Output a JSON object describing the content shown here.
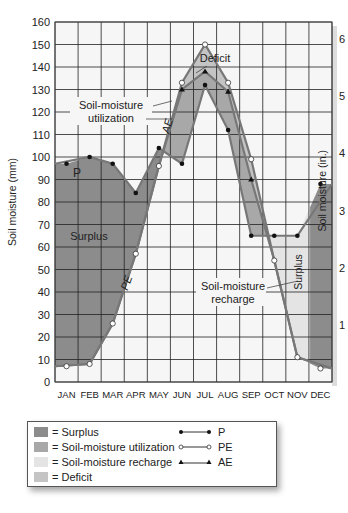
{
  "chart_data": {
    "type": "line",
    "title": "",
    "xlabel": "",
    "ylabel": "Soil moisture (mm)",
    "ylabel_right": "Soil moisture (in.)",
    "ylim": [
      0,
      160
    ],
    "ylim_right": [
      0,
      6.3
    ],
    "yticks": [
      0,
      10,
      20,
      30,
      40,
      50,
      60,
      70,
      80,
      90,
      100,
      110,
      120,
      130,
      140,
      150,
      160
    ],
    "yticks_right": [
      1,
      2,
      3,
      4,
      5,
      6
    ],
    "grid": true,
    "categories": [
      "JAN",
      "FEB",
      "MAR",
      "APR",
      "MAY",
      "JUN",
      "JUL",
      "AUG",
      "SEP",
      "OCT",
      "NOV",
      "DEC"
    ],
    "series": [
      {
        "name": "P",
        "marker": "filled-circle",
        "values": [
          97,
          100,
          97,
          84,
          104,
          97,
          132,
          112,
          65,
          65,
          65,
          88
        ]
      },
      {
        "name": "PE",
        "marker": "open-circle",
        "values": [
          7,
          8,
          26,
          57,
          96,
          133,
          150,
          133,
          99,
          54,
          11,
          6
        ]
      },
      {
        "name": "AE",
        "marker": "triangle",
        "values": [
          7,
          8,
          26,
          57,
          96,
          130,
          138,
          129,
          90,
          54,
          11,
          6
        ]
      }
    ],
    "annotations": [
      {
        "text": "Deficit",
        "x": "JUL",
        "y": 145
      },
      {
        "text": "Soil-moisture utilization",
        "x": "APR",
        "y": 125
      },
      {
        "text": "AE",
        "x": "JUN",
        "y": 112
      },
      {
        "text": "P",
        "x": "FEB",
        "y": 93
      },
      {
        "text": "Surplus",
        "x": "FEB",
        "y": 67
      },
      {
        "text": "PE",
        "x": "APR",
        "y": 45
      },
      {
        "text": "Soil-moisture recharge",
        "x": "AUG",
        "y": 42
      },
      {
        "text": "Surplus",
        "x": "DEC",
        "y": 50
      }
    ],
    "regions": [
      {
        "name": "Surplus",
        "color": "#8c8c8c"
      },
      {
        "name": "Soil-moisture utilization",
        "color": "#a8a8a8"
      },
      {
        "name": "Soil-moisture recharge",
        "color": "#e4e4e4"
      },
      {
        "name": "Deficit",
        "color": "#c4c4c4"
      }
    ],
    "legend_position": "bottom"
  },
  "legend": {
    "areas": [
      {
        "label": "= Surplus",
        "color": "#8c8c8c"
      },
      {
        "label": "= Soil-moisture utilization",
        "color": "#a8a8a8"
      },
      {
        "label": "= Soil-moisture recharge",
        "color": "#e4e4e4"
      },
      {
        "label": "= Deficit",
        "color": "#c4c4c4"
      }
    ],
    "lines": [
      {
        "label": "P",
        "marker": "filled-circle"
      },
      {
        "label": "PE",
        "marker": "open-circle"
      },
      {
        "label": "AE",
        "marker": "triangle"
      }
    ]
  }
}
